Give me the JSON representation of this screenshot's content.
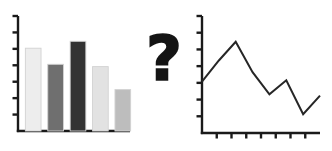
{
  "figure": {
    "name": "bar-chart-to-line-chart-transformation",
    "background_color": "#ffffff",
    "axis_color": "#1a1a1a",
    "separator_glyph": "?",
    "separator_name": "question-mark"
  },
  "chart_data": [
    {
      "type": "bar",
      "name": "left-bar-chart",
      "title": "",
      "xlabel": "",
      "ylabel": "",
      "categories": [
        "1",
        "2",
        "3",
        "4",
        "5"
      ],
      "values": [
        72,
        58,
        78,
        56,
        36
      ],
      "ylim": [
        0,
        100
      ],
      "xlim": [
        0,
        5
      ],
      "grid": false,
      "legend": null,
      "y_tick_count": 7,
      "x_tick_count": 0,
      "bar_colors": [
        "#ededed",
        "#6f6f6f",
        "#333333",
        "#e2e2e2",
        "#bdbdbd"
      ],
      "bar_edge_color": "#d2d2d2"
    },
    {
      "type": "line",
      "name": "right-line-chart",
      "title": "",
      "xlabel": "",
      "ylabel": "",
      "x": [
        0,
        1,
        2,
        3,
        4,
        5,
        6,
        7
      ],
      "values": [
        44,
        62,
        78,
        52,
        33,
        45,
        16,
        32
      ],
      "ylim": [
        0,
        100
      ],
      "xlim": [
        0,
        7
      ],
      "grid": false,
      "legend": null,
      "y_tick_count": 7,
      "x_tick_count": 7,
      "line_color": "#262626",
      "line_width": 2,
      "markers": false
    }
  ]
}
